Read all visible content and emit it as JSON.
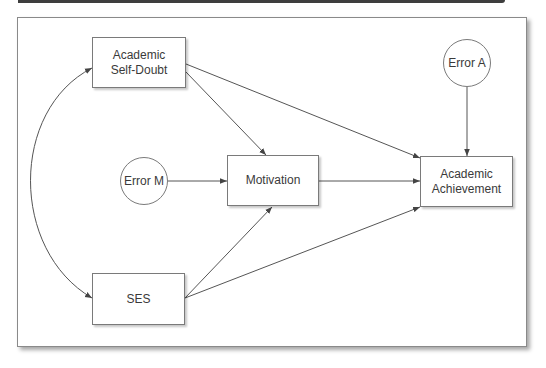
{
  "diagram": {
    "type": "path-model",
    "nodes": [
      {
        "id": "self_doubt",
        "label": "Academic\nSelf-Doubt",
        "shape": "rect"
      },
      {
        "id": "ses",
        "label": "SES",
        "shape": "rect"
      },
      {
        "id": "error_m",
        "label": "Error M",
        "shape": "circle"
      },
      {
        "id": "motivation",
        "label": "Motivation",
        "shape": "rect"
      },
      {
        "id": "error_a",
        "label": "Error A",
        "shape": "circle"
      },
      {
        "id": "achievement",
        "label": "Academic\nAchievement",
        "shape": "rect"
      }
    ],
    "edges": [
      {
        "from": "self_doubt",
        "to": "ses",
        "type": "bidirectional-curved"
      },
      {
        "from": "self_doubt",
        "to": "motivation",
        "type": "directed"
      },
      {
        "from": "self_doubt",
        "to": "achievement",
        "type": "directed"
      },
      {
        "from": "error_m",
        "to": "motivation",
        "type": "directed"
      },
      {
        "from": "motivation",
        "to": "achievement",
        "type": "directed"
      },
      {
        "from": "ses",
        "to": "motivation",
        "type": "directed"
      },
      {
        "from": "ses",
        "to": "achievement",
        "type": "directed"
      },
      {
        "from": "error_a",
        "to": "achievement",
        "type": "directed"
      }
    ],
    "colors": {
      "line": "#555555",
      "border": "#7a7a7a",
      "text": "#3a3a3a",
      "topbar": "#3e3e3e"
    }
  }
}
